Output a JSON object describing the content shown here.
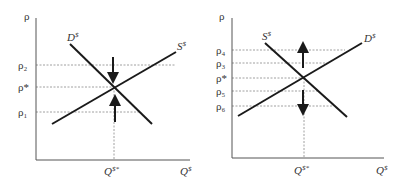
{
  "diagrams": [
    {
      "name": "excess-supply-demand-left",
      "y_axis_label": "ρ",
      "x_axis_label": "Q",
      "x_axis_label_sup": "$",
      "equilibrium_q_label": "Q",
      "equilibrium_q_sup": "$*",
      "curves": [
        {
          "label": "D",
          "sup": "$",
          "type": "demand"
        },
        {
          "label": "S",
          "sup": "$",
          "type": "supply"
        }
      ],
      "price_levels": [
        {
          "label": "ρ₂"
        },
        {
          "label": "ρ*"
        },
        {
          "label": "ρ₁"
        }
      ],
      "arrows": [
        "down toward equilibrium from ρ₂",
        "up toward equilibrium from ρ₁"
      ]
    },
    {
      "name": "unstable-equilibrium-right",
      "y_axis_label": "ρ",
      "x_axis_label": "Q",
      "x_axis_label_sup": "$",
      "equilibrium_q_label": "Q",
      "equilibrium_q_sup": "$*",
      "curves": [
        {
          "label": "S",
          "sup": "$",
          "type": "supply"
        },
        {
          "label": "D",
          "sup": "$",
          "type": "demand"
        }
      ],
      "price_levels": [
        {
          "label": "ρ₄"
        },
        {
          "label": "ρ₃"
        },
        {
          "label": "ρ*"
        },
        {
          "label": "ρ₅"
        },
        {
          "label": "ρ₆"
        }
      ],
      "arrows": [
        "up away from equilibrium",
        "down away from equilibrium"
      ]
    }
  ],
  "colors": {
    "line": "#1a1a1a",
    "guide": "#888888",
    "text": "#333333"
  }
}
